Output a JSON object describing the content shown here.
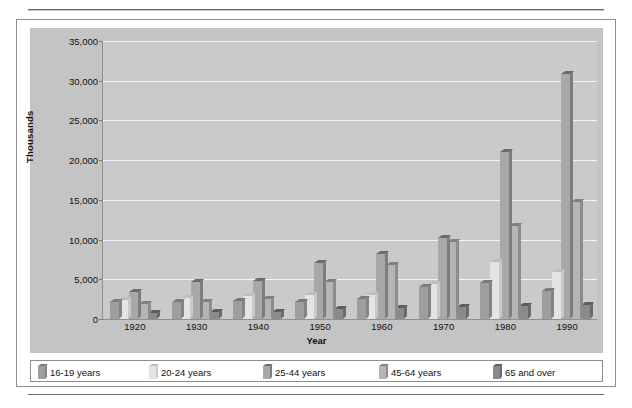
{
  "chart_data": {
    "type": "bar",
    "title": "",
    "xlabel": "Year",
    "ylabel": "Thousands",
    "categories": [
      "1920",
      "1930",
      "1940",
      "1950",
      "1960",
      "1970",
      "1980",
      "1990"
    ],
    "ylim": [
      0,
      35000
    ],
    "ytick_labels": [
      "0",
      "5,000",
      "10,000",
      "15,000",
      "20,000",
      "25,000",
      "30,000",
      "35,000"
    ],
    "ytick_values": [
      0,
      5000,
      10000,
      15000,
      20000,
      25000,
      30000,
      35000
    ],
    "grid": true,
    "legend_position": "bottom",
    "series": [
      {
        "name": "16-19 years",
        "color": "#9e9e9e",
        "top_color": "#7a7a7a",
        "side_color": "#848484",
        "values": [
          2100,
          2200,
          2300,
          2200,
          2500,
          4000,
          4500,
          3500
        ]
      },
      {
        "name": "20-24 years",
        "color": "#e4e4e4",
        "top_color": "#bdbdbd",
        "side_color": "#c9c9c9",
        "values": [
          2400,
          2700,
          2900,
          3000,
          3000,
          4400,
          7200,
          5900
        ]
      },
      {
        "name": "25-44 years",
        "color": "#a8a8a8",
        "top_color": "#6b6b6b",
        "side_color": "#7d7d7d",
        "values": [
          3400,
          4700,
          4800,
          7000,
          8200,
          10200,
          21000,
          30800
        ]
      },
      {
        "name": "45-64 years",
        "color": "#b5b5b5",
        "top_color": "#7f7f7f",
        "side_color": "#8c8c8c",
        "values": [
          1900,
          2200,
          2500,
          4600,
          6800,
          9700,
          11700,
          14700
        ]
      },
      {
        "name": "65 and over",
        "color": "#8a8a8a",
        "top_color": "#5c5c5c",
        "side_color": "#6a6a6a",
        "values": [
          800,
          900,
          900,
          1200,
          1400,
          1500,
          1600,
          1800
        ]
      }
    ]
  },
  "axis": {
    "y_title": "Thousands",
    "x_title": "Year"
  },
  "caption": {
    "text": ""
  }
}
